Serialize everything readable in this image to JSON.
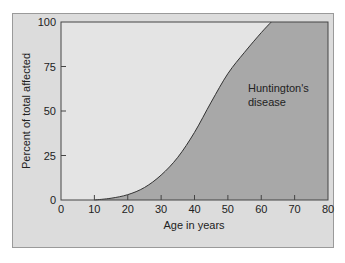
{
  "chart_data": {
    "type": "area",
    "title": "",
    "xlabel": "Age in years",
    "ylabel": "Percent of total affected",
    "xlim": [
      0,
      80
    ],
    "ylim": [
      0,
      100
    ],
    "x_ticks": [
      0,
      10,
      20,
      30,
      40,
      50,
      60,
      70,
      80
    ],
    "y_ticks": [
      0,
      25,
      50,
      75,
      100
    ],
    "grid": false,
    "legend": null,
    "series": [
      {
        "name": "Huntington's disease",
        "x": [
          10,
          15,
          20,
          25,
          30,
          35,
          40,
          45,
          50,
          55,
          60,
          63,
          80
        ],
        "values": [
          0,
          1,
          3,
          7,
          14,
          24,
          38,
          55,
          71,
          83,
          94,
          100,
          100
        ]
      }
    ],
    "annotations": [
      {
        "text_line1": "Huntington's",
        "text_line2": "disease",
        "x": 62,
        "y": 62
      }
    ],
    "colors": {
      "panel_bg": "#dcdcdc",
      "plot_bg": "#e4e4e4",
      "area_fill": "#a8a8a8",
      "curve": "#333333",
      "axis": "#444444"
    }
  }
}
